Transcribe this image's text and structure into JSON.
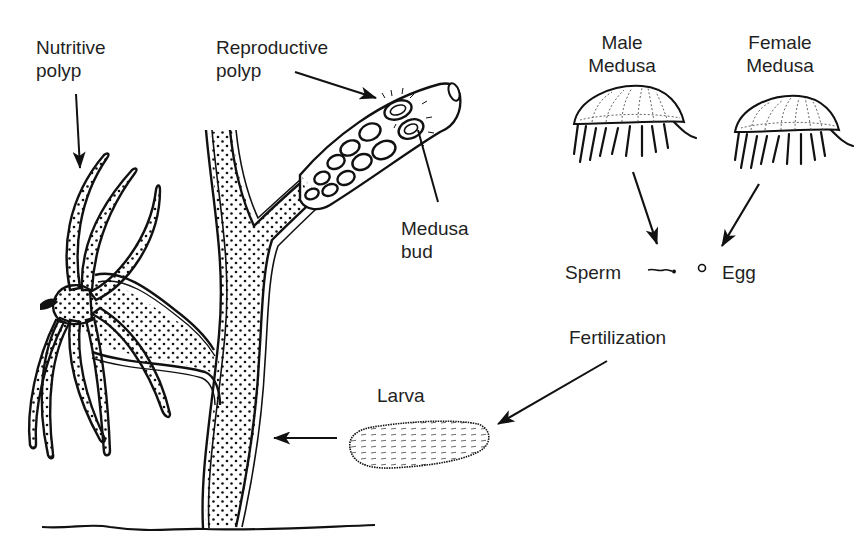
{
  "diagram": {
    "colors": {
      "ink": "#111111",
      "text": "#1f1f1f",
      "background": "#ffffff"
    },
    "labels": {
      "nutritive_polyp": {
        "line1": "Nutritive",
        "line2": "polyp"
      },
      "reproductive_polyp": {
        "line1": "Reproductive",
        "line2": "polyp"
      },
      "medusa_bud": {
        "line1": "Medusa",
        "line2": "bud"
      },
      "male_medusa": {
        "line1": "Male",
        "line2": "Medusa"
      },
      "female_medusa": {
        "line1": "Female",
        "line2": "Medusa"
      },
      "sperm": "Sperm",
      "egg": "Egg",
      "fertilization": "Fertilization",
      "larva": "Larva"
    },
    "nodes": [
      {
        "id": "colony",
        "name": "Polyp colony"
      },
      {
        "id": "nutritive_polyp",
        "name": "Nutritive polyp"
      },
      {
        "id": "reproductive_polyp",
        "name": "Reproductive polyp"
      },
      {
        "id": "medusa_bud",
        "name": "Medusa bud"
      },
      {
        "id": "male_medusa",
        "name": "Male Medusa"
      },
      {
        "id": "female_medusa",
        "name": "Female Medusa"
      },
      {
        "id": "sperm",
        "name": "Sperm"
      },
      {
        "id": "egg",
        "name": "Egg"
      },
      {
        "id": "larva",
        "name": "Larva"
      }
    ],
    "edges": [
      {
        "from": "nutritive_polyp_label",
        "to": "nutritive_polyp",
        "type": "pointer"
      },
      {
        "from": "reproductive_polyp_label",
        "to": "reproductive_polyp",
        "type": "pointer"
      },
      {
        "from": "medusa_bud_label",
        "to": "medusa_bud",
        "type": "pointer"
      },
      {
        "from": "male_medusa",
        "to": "sperm",
        "type": "process"
      },
      {
        "from": "female_medusa",
        "to": "egg",
        "type": "process"
      },
      {
        "from": "fertilization",
        "to": "larva",
        "type": "process"
      },
      {
        "from": "larva",
        "to": "colony",
        "type": "process"
      }
    ]
  }
}
